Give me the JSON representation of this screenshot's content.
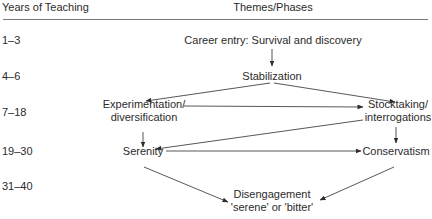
{
  "header": {
    "years_label": "Years of Teaching",
    "themes_label": "Themes/Phases"
  },
  "rows": [
    {
      "years": "1–3"
    },
    {
      "years": "4–6"
    },
    {
      "years": "7–18"
    },
    {
      "years": "19–30"
    },
    {
      "years": "31–40"
    }
  ],
  "nodes": {
    "career_entry": "Career entry: Survival and discovery",
    "stabilization": "Stabilization",
    "experimentation_l1": "Experimentation/",
    "experimentation_l2": "diversification",
    "stocktaking_l1": "Stocktaking/",
    "stocktaking_l2": "interrogations",
    "serenity": "Serenity",
    "conservatism": "Conservatism",
    "disengagement_l1": "Disengagement",
    "disengagement_l2": "'serene' or 'bitter'"
  },
  "edges": [
    {
      "from": "Career entry",
      "to": "Stabilization"
    },
    {
      "from": "Stabilization",
      "to": "Experimentation/diversification"
    },
    {
      "from": "Stabilization",
      "to": "Stocktaking/interrogations"
    },
    {
      "from": "Experimentation/diversification",
      "to": "Stocktaking/interrogations"
    },
    {
      "from": "Experimentation/diversification",
      "to": "Serenity"
    },
    {
      "from": "Stocktaking/interrogations",
      "to": "Serenity"
    },
    {
      "from": "Stocktaking/interrogations",
      "to": "Conservatism"
    },
    {
      "from": "Serenity",
      "to": "Conservatism"
    },
    {
      "from": "Serenity",
      "to": "Disengagement"
    },
    {
      "from": "Conservatism",
      "to": "Disengagement"
    }
  ]
}
